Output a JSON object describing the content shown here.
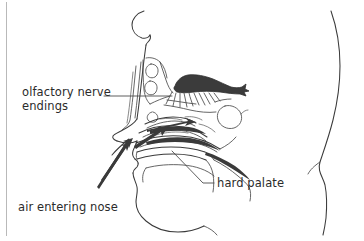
{
  "figure": {
    "type": "anatomical-diagram",
    "background_color": "#ffffff",
    "ink_color": "#3a3a3a",
    "text_color": "#2b2b2b",
    "width": 364,
    "height": 241
  },
  "labels": {
    "olfactory": {
      "line1": "olfactory nerve",
      "line2": "endings"
    },
    "hard_palate": "hard palate",
    "air_entering": "air entering nose"
  },
  "parts": {
    "head_profile": "head-profile-outline",
    "back_of_head": "back-of-head-outline",
    "olfactory_bulb": "olfactory-bulb",
    "nerve_filaments": "olfactory-nerve-filaments",
    "sinus_upper": "frontal-sinus-cavity",
    "sinus_lower": "ethmoid-sinus-cavity",
    "sphenoid_sinus": "sphenoid-sinus-cavity",
    "turbinates": "nasal-turbinates",
    "hard_palate_shape": "hard-palate",
    "soft_palate": "soft-palate",
    "airflow_arrows": "airflow-arrows",
    "nostril": "nostril-opening",
    "lips": "lips-profile",
    "chin": "chin-and-jaw-line"
  },
  "leaders": {
    "olfactory_leader": "horizontal-leader-line",
    "hard_palate_leader": "diagonal-leader-line",
    "air_leader": "diagonal-leader-line"
  },
  "frame": {
    "left_rule": "left-vertical-rule"
  }
}
